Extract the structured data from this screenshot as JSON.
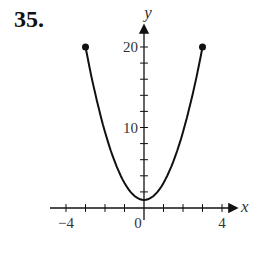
{
  "problem_number": "35.",
  "chart_data": {
    "type": "line",
    "title": "",
    "xlabel": "x",
    "ylabel": "y",
    "xlim": [
      -5,
      5
    ],
    "ylim": [
      0,
      22
    ],
    "x_tick_labels": [
      "−4",
      "0",
      "4"
    ],
    "y_tick_labels": [
      "10",
      "20"
    ],
    "x_ticks": [
      -4,
      -3,
      -2,
      -1,
      0,
      1,
      2,
      3,
      4
    ],
    "y_ticks": [
      2,
      4,
      6,
      8,
      10,
      12,
      14,
      16,
      18,
      20
    ],
    "grid": false,
    "series": [
      {
        "name": "curve",
        "x": [
          -3,
          -2.5,
          -2,
          -1.5,
          -1,
          -0.5,
          0,
          0.5,
          1,
          1.5,
          2,
          2.5,
          3
        ],
        "y": [
          20,
          14.2,
          9.4,
          5.8,
          3.1,
          1.5,
          1,
          1.5,
          3.1,
          5.8,
          9.4,
          14.2,
          20
        ],
        "endpoints": [
          [
            -3,
            20
          ],
          [
            3,
            20
          ]
        ]
      }
    ]
  }
}
